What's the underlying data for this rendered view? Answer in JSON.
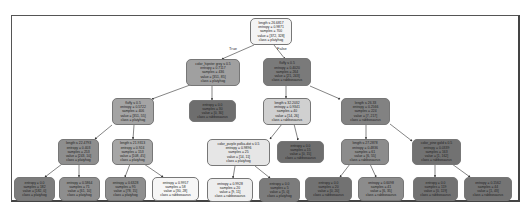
{
  "diagram": {
    "type": "decision-tree",
    "edge_labels": {
      "true": "True",
      "false": "False"
    },
    "colors": {
      "very_light": "#f0f0f0",
      "light": "#d4d4d4",
      "mid": "#a8a8a8",
      "mid_dark": "#909090",
      "dark": "#7a7a7a",
      "darkest": "#6c6c6c"
    },
    "nodes": [
      {
        "id": "n0",
        "lines": [
          "length ≤ 26.6817",
          "entropy = 0.9871",
          "samples = 700",
          "value = [372, 328]",
          "class = platyhog"
        ]
      },
      {
        "id": "n1",
        "lines": [
          "color_hipster grey ≤ 0.5",
          "entropy = 0.7117",
          "samples = 436",
          "value = [351, 85]",
          "class = platyhog"
        ]
      },
      {
        "id": "n2",
        "lines": [
          "fluffy ≤ 0.5",
          "entropy = 0.4020",
          "samples = 264",
          "value = [21, 243]",
          "class = rabbosaurus"
        ]
      },
      {
        "id": "n3",
        "lines": [
          "fluffy ≤ 0.5",
          "entropy = 0.5722",
          "samples = 406",
          "value = [351, 55]",
          "class = platyhog"
        ]
      },
      {
        "id": "n4",
        "lines": [
          "entropy = 0.0",
          "samples = 30",
          "value = [0, 30]",
          "class = rabbosaurus"
        ]
      },
      {
        "id": "n5",
        "lines": [
          "length ≤ 32.2032",
          "entropy = 0.9341",
          "samples = 40",
          "value = [14, 26]",
          "class = rabbosaurus"
        ]
      },
      {
        "id": "n6",
        "lines": [
          "length ≤ 26.33",
          "entropy = 0.2566",
          "samples = 224",
          "value = [7, 217]",
          "class = rabbosaurus"
        ]
      },
      {
        "id": "n7",
        "lines": [
          "length ≤ 22.4793",
          "entropy = 0.403",
          "samples = 253",
          "value = [243, 10]",
          "class = platyhog"
        ]
      },
      {
        "id": "n8",
        "lines": [
          "length ≤ 21.9313",
          "entropy = 0.924",
          "samples = 153",
          "value = [108, 45]",
          "class = platyhog"
        ]
      },
      {
        "id": "n9",
        "lines": [
          "color_purple polka-dot ≤ 0.5",
          "entropy = 0.9896",
          "samples = 25",
          "value = [14, 11]",
          "class = platyhog"
        ]
      },
      {
        "id": "n10",
        "lines": [
          "entropy = 0.0",
          "samples = 15",
          "value = [0, 15]",
          "class = rabbosaurus"
        ]
      },
      {
        "id": "n11",
        "lines": [
          "length ≤ 27.2878",
          "entropy = 0.4836",
          "samples = 61",
          "value = [6, 55]",
          "class = rabbosaurus"
        ]
      },
      {
        "id": "n12",
        "lines": [
          "color_pine gold ≤ 0.5",
          "entropy = 0.0339",
          "samples = 163",
          "value = [1, 162]",
          "class = rabbosaurus"
        ]
      },
      {
        "id": "n13",
        "lines": [
          "entropy = 0.0",
          "samples = 182",
          "value = [182, 0]",
          "class = platyhog"
        ]
      },
      {
        "id": "n14",
        "lines": [
          "entropy = 0.5864",
          "samples = 71",
          "value = [61, 10]",
          "class = platyhog"
        ]
      },
      {
        "id": "n15",
        "lines": [
          "entropy = 0.6328",
          "samples = 95",
          "value = [78, 15]",
          "class = platyhog"
        ]
      },
      {
        "id": "n16",
        "lines": [
          "entropy = 0.9957",
          "samples = 58",
          "value = [30, 28]",
          "class = rabbosaurus"
        ]
      },
      {
        "id": "n17",
        "lines": [
          "entropy = 0.9928",
          "samples = 20",
          "value = [9, 11]",
          "class = rabbosaurus"
        ]
      },
      {
        "id": "n18",
        "lines": [
          "entropy = 0.0",
          "samples = 5",
          "value = [5, 0]",
          "class = platyhog"
        ]
      },
      {
        "id": "n19",
        "lines": [
          "entropy = 0.0",
          "samples = 20",
          "value = [0, 20]",
          "class = rabbosaurus"
        ]
      },
      {
        "id": "n20",
        "lines": [
          "entropy = 0.6098",
          "samples = 41",
          "value = [6, 35]",
          "class = rabbosaurus"
        ]
      },
      {
        "id": "n21",
        "lines": [
          "entropy = 0.0",
          "samples = 119",
          "value = [0, 119]",
          "class = rabbosaurus"
        ]
      },
      {
        "id": "n22",
        "lines": [
          "entropy = 0.1562",
          "samples = 44",
          "value = [1, 43]",
          "class = rabbosaurus"
        ]
      }
    ]
  }
}
